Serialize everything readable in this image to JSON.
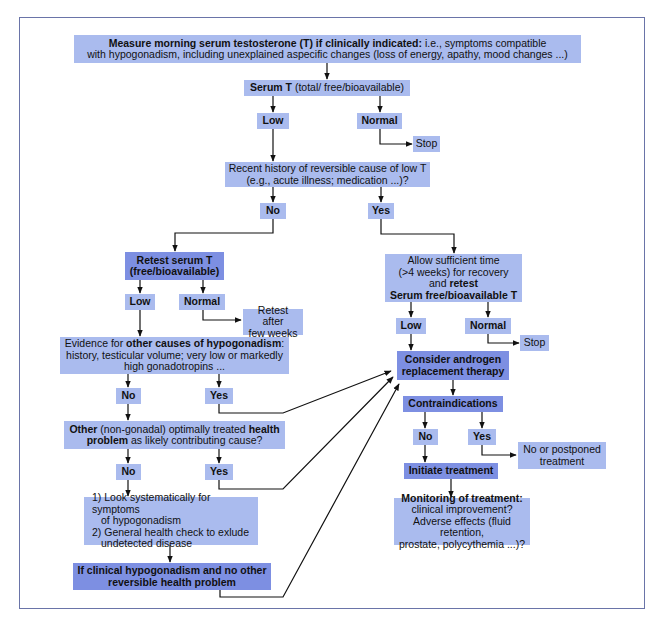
{
  "diagram": {
    "start": {
      "bold": "Measure morning serum testosterone (T) if clinically indicated:",
      "rest1": " i.e., symptoms compatible",
      "line2": "with hypogonadism, including unexplained aspecific changes (loss of energy, apathy, mood changes ...)"
    },
    "serum_t": {
      "bold": "Serum T",
      "rest": " (total/ free/bioavailable)"
    },
    "serum_low": "Low",
    "serum_normal": "Normal",
    "stop1": "Stop",
    "reversible": {
      "line1": "Recent history of reversible cause of low T",
      "line2": "(e.g., acute illness; medication ...)?"
    },
    "rev_no": "No",
    "rev_yes": "Yes",
    "retest": {
      "line1": "Retest serum T",
      "line2": "(free/bioavailable)"
    },
    "retest_low": "Low",
    "retest_normal": "Normal",
    "retest_after": {
      "line1": "Retest after",
      "line2": "few weeks"
    },
    "other_causes": {
      "pre": "Evidence for ",
      "bold": "other causes of hypogonadism",
      "post": ":",
      "line2": "history, testicular volume; very low or markedly",
      "line3": "high gonadotropins ..."
    },
    "oc_no": "No",
    "oc_yes": "Yes",
    "health_problem": {
      "bold1": "Other",
      "mid1": " (non-gonadal) optimally treated ",
      "bold2": "health",
      "bold3": "problem",
      "mid2": " as likely contributing cause?"
    },
    "hp_no": "No",
    "hp_yes": "Yes",
    "look": {
      "line1": "1) Look systematically for symptoms",
      "line2": "of hypogonadism",
      "line3": "2) General health check to exlude",
      "line4": "undetected disease"
    },
    "if_clinical": {
      "line1": "If clinical hypogonadism and no other",
      "line2": "reversible health problem"
    },
    "allow": {
      "line1": "Allow sufficient time",
      "line2": "(>4 weeks) for recovery",
      "line3_pre": "and ",
      "line3_bold": "retest",
      "line4": "Serum free/bioavailable T"
    },
    "allow_low": "Low",
    "allow_normal": "Normal",
    "stop2": "Stop",
    "consider": {
      "line1": "Consider androgen",
      "line2": "replacement therapy"
    },
    "contra": "Contraindications",
    "contra_no": "No",
    "contra_yes": "Yes",
    "postponed": {
      "line1": "No or postponed",
      "line2": "treatment"
    },
    "initiate": "Initiate treatment",
    "monitoring": {
      "bold": "Monitoring of treatment:",
      "line2": "clinical improvement?",
      "line3": "Adverse effects (fluid retention,",
      "line4": "prostate, polycythemia ...)?"
    },
    "colors": {
      "light_box": "#aabbee",
      "dark_box": "#7d8fe2",
      "frame": "#6a74a8"
    }
  }
}
